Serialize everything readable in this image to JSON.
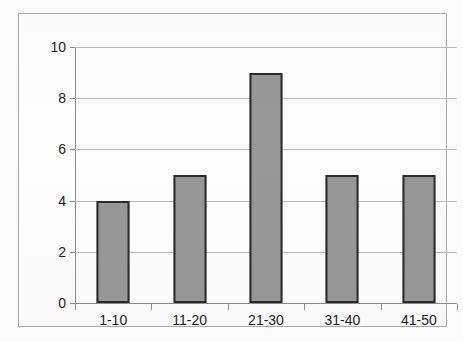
{
  "chart_data": {
    "type": "bar",
    "title": "",
    "subtitle": "",
    "xlabel": "",
    "ylabel": "",
    "categories": [
      "1-10",
      "11-20",
      "21-30",
      "31-40",
      "41-50"
    ],
    "values": [
      4,
      5,
      9,
      5,
      5
    ],
    "series": [
      {
        "name": "Frequency",
        "values": [
          4,
          5,
          9,
          5,
          5
        ]
      }
    ],
    "ylim": [
      0,
      10
    ],
    "ytick_step": 2,
    "ytick_labels": [
      "0",
      "2",
      "4",
      "6",
      "8",
      "10"
    ],
    "ytick_values": [
      0,
      2,
      4,
      6,
      8,
      10
    ],
    "grid": true,
    "grid_axis": "y",
    "legend": false,
    "legend_position": "none",
    "annotations": [],
    "colors": {
      "bar_fill": "#989898",
      "bar_border": "#2c2c2c",
      "gridline": "#b9b9b9",
      "axis": "#8d8d8d",
      "text": "#1c1c1c",
      "frame": "#a8a8a8",
      "background": "#fdfdfd"
    }
  }
}
